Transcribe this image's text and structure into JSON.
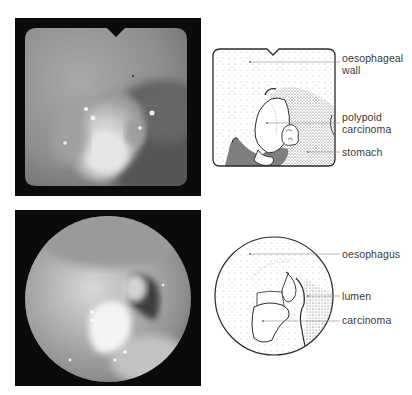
{
  "figure": {
    "top": {
      "photo": {
        "description": "endoscopic photograph, square field with notch",
        "frame_color": "#0b0b0b"
      },
      "diagram": {
        "labels": [
          {
            "id": "oesophageal-wall",
            "line1": "oesophageal",
            "line2": "wall"
          },
          {
            "id": "polypoid-carcinoma",
            "line1": "polypoid",
            "line2": "carcinoma"
          },
          {
            "id": "stomach",
            "line1": "stomach",
            "line2": ""
          }
        ]
      }
    },
    "bottom": {
      "photo": {
        "description": "endoscopic photograph, circular field",
        "frame_color": "#0b0b0b"
      },
      "diagram": {
        "labels": [
          {
            "id": "oesophagus",
            "line1": "oesophagus"
          },
          {
            "id": "lumen",
            "line1": "lumen"
          },
          {
            "id": "carcinoma",
            "line1": "carcinoma"
          }
        ]
      }
    }
  },
  "colors": {
    "frame": "#0b0b0b",
    "outline": "#2a2a2a",
    "leader": "#8a8a8a",
    "text": "#3a3a3a"
  }
}
